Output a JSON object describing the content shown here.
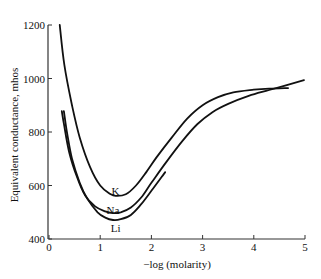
{
  "chart_data": {
    "type": "line",
    "title": "",
    "xlabel": "−log (molarity)",
    "ylabel": "Equivalent conductance, mhos",
    "xlim": [
      0,
      5
    ],
    "ylim": [
      400,
      1200
    ],
    "xticks": [
      0,
      1,
      2,
      3,
      4,
      5
    ],
    "yticks": [
      400,
      600,
      800,
      1000,
      1200
    ],
    "grid": false,
    "legend": "inline curve labels",
    "series": [
      {
        "name": "K",
        "x": [
          0.21,
          0.3,
          0.45,
          0.6,
          0.8,
          1.0,
          1.2,
          1.3,
          1.5,
          1.7,
          1.9,
          2.1,
          2.4,
          2.7,
          3.0,
          3.3,
          3.6,
          4.0,
          4.3,
          4.67
        ],
        "y": [
          1200,
          1050,
          900,
          780,
          670,
          600,
          568,
          561,
          567,
          600,
          650,
          705,
          780,
          850,
          900,
          930,
          948,
          958,
          962,
          964
        ]
      },
      {
        "name": "Na",
        "x": [
          0.25,
          0.3,
          0.4,
          0.55,
          0.7,
          0.9,
          1.1,
          1.25,
          1.4,
          1.6,
          1.8,
          2.0,
          2.3,
          2.6,
          2.9,
          3.2,
          3.5,
          3.9,
          4.3,
          4.98
        ],
        "y": [
          878,
          820,
          720,
          630,
          565,
          522,
          503,
          497,
          500,
          518,
          555,
          610,
          690,
          765,
          830,
          875,
          905,
          935,
          957,
          994
        ]
      },
      {
        "name": "Li",
        "x": [
          0.29,
          0.35,
          0.45,
          0.6,
          0.75,
          0.95,
          1.1,
          1.25,
          1.4,
          1.6,
          1.8,
          2.0,
          2.27
        ],
        "y": [
          878,
          800,
          700,
          610,
          550,
          500,
          480,
          471,
          474,
          490,
          530,
          580,
          650
        ]
      }
    ],
    "annotations": [
      {
        "text": "K",
        "x": 1.3,
        "y": 580
      },
      {
        "text": "Na",
        "x": 1.25,
        "y": 510
      },
      {
        "text": "Li",
        "x": 1.3,
        "y": 440
      }
    ]
  }
}
